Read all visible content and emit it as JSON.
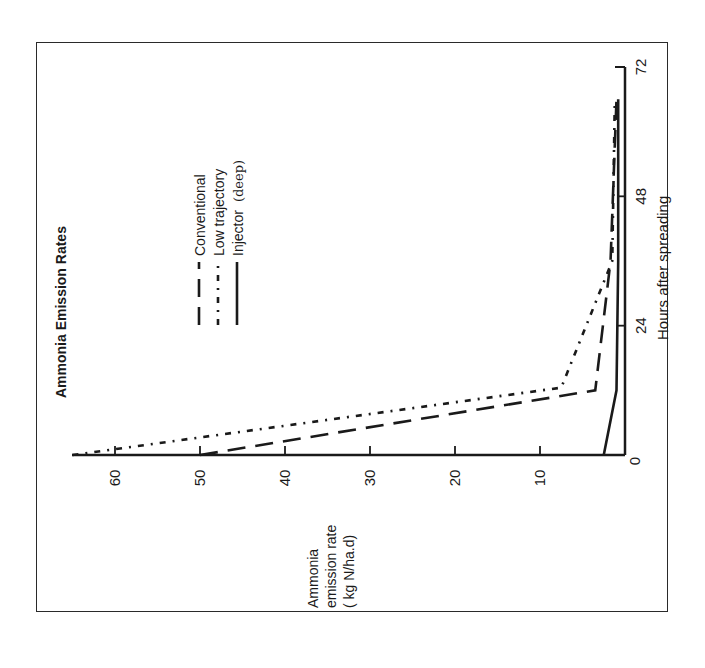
{
  "chart_data": {
    "type": "line",
    "orientation": "rotated 90 degrees counter-clockwise",
    "title": "Ammonia Emission Rates",
    "xlabel": "Hours after spreading",
    "ylabel": "Ammonia emission rate ( kg N/ha.d)",
    "ylabel_lines": [
      "Ammonia",
      "emission rate",
      "( kg N/ha.d)"
    ],
    "x_ticks": [
      "0",
      "24",
      "48",
      "72"
    ],
    "y_ticks": [
      "10",
      "20",
      "30",
      "40",
      "50",
      "60"
    ],
    "xlim": [
      0,
      72
    ],
    "ylim": [
      0,
      65
    ],
    "grid": false,
    "legend_position": "upper left (rotated)",
    "series": [
      {
        "name": "Conventional",
        "style": "long-dash",
        "x": [
          0,
          12,
          36,
          66
        ],
        "y": [
          50,
          3.5,
          1.7,
          1.0
        ]
      },
      {
        "name": "Low trajectory",
        "style": "short-dash-dot",
        "x": [
          0,
          12.5,
          36,
          66
        ],
        "y": [
          65,
          7.5,
          1.5,
          1.2
        ]
      },
      {
        "name": "Injector (deep)",
        "style": "solid",
        "x": [
          0,
          12,
          36,
          66
        ],
        "y": [
          2.5,
          1.0,
          0.8,
          0.8
        ]
      }
    ]
  },
  "legend": {
    "items": [
      {
        "label": "Conventional"
      },
      {
        "label": "Low trajectory"
      },
      {
        "label": "Injector",
        "suffix": "(deep)"
      }
    ]
  },
  "colors": {
    "ink": "#1a1a1a",
    "background": "#ffffff"
  }
}
